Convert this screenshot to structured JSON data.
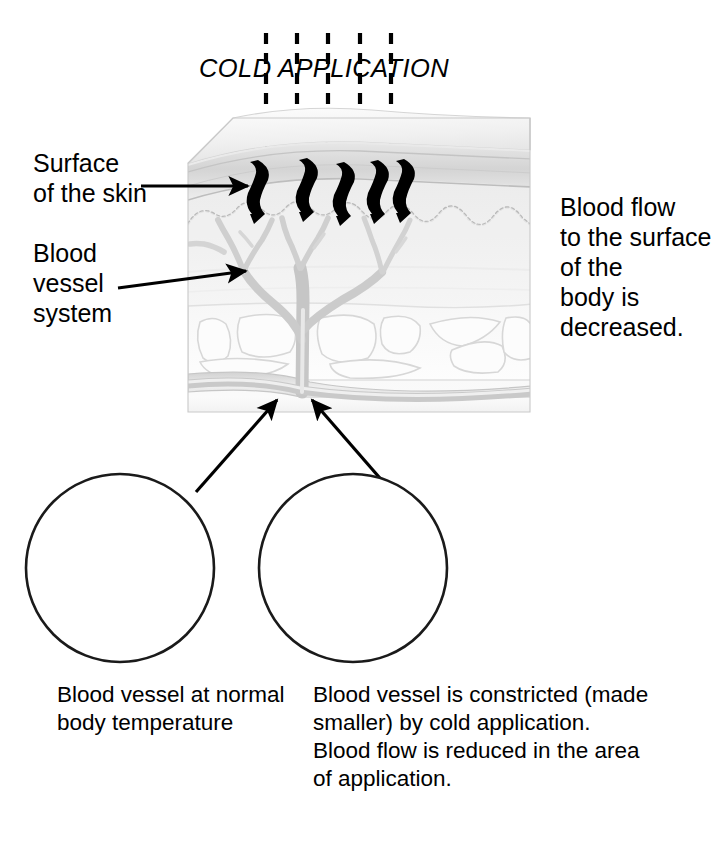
{
  "figure": {
    "title": "COLD APPLICATION",
    "type": "anatomical-diagram"
  },
  "labels": {
    "surface_of_skin": {
      "lines": [
        "Surface",
        "of the skin"
      ],
      "line1": "Surface",
      "line2": "of the skin"
    },
    "blood_vessel_system": {
      "lines": [
        "Blood",
        "vessel",
        "system"
      ],
      "line1": "Blood",
      "line2": "vessel",
      "line3": "system"
    },
    "blood_flow_note": {
      "lines": [
        "Blood flow",
        "to the surface",
        "of the",
        "body is",
        "decreased."
      ],
      "line1": "Blood flow",
      "line2": "to the surface",
      "line3": "of the",
      "line4": "body is",
      "line5": "decreased."
    }
  },
  "captions": {
    "left_inset": {
      "lines": [
        "Blood vessel at normal",
        "body temperature"
      ],
      "line1": "Blood vessel at normal",
      "line2": "body temperature"
    },
    "right_inset": {
      "lines": [
        "Blood vessel is constricted (made",
        "smaller) by cold application.",
        "Blood flow is reduced in the area",
        "of application."
      ],
      "line1": "Blood vessel is constricted (made",
      "line2": "smaller) by cold application.",
      "line3": "Blood flow is reduced in the area",
      "line4": "of application."
    }
  },
  "icons": {
    "cold_arrows_count": 5,
    "cold_penetration_squiggles_count": 5,
    "leader_arrows_count": 4
  },
  "colors": {
    "ink": "#000000",
    "outline": "#1a1a1a",
    "skin_light": "#f5f5f5",
    "skin_mid": "#e8e8e8",
    "skin_shade": "#dcdcdc",
    "vessel": "#c2c2c2",
    "lobule_fill": "#fcfcfc",
    "lobule_stroke": "#d7d7d7",
    "background": "#ffffff"
  }
}
